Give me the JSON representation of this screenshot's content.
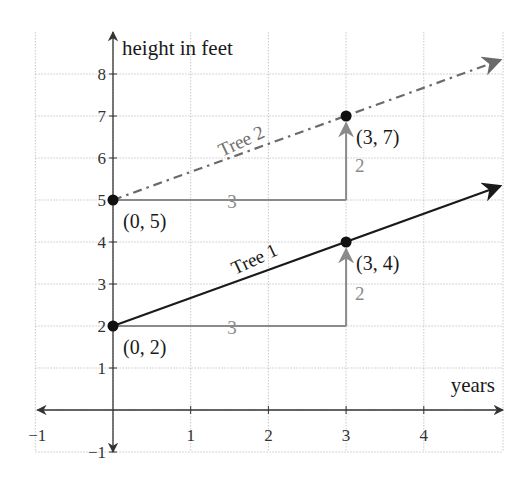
{
  "chart_data": {
    "type": "line",
    "title": "",
    "xlabel": "years",
    "ylabel": "height in feet",
    "xlim": [
      -1,
      5
    ],
    "ylim": [
      -1,
      8.5
    ],
    "grid": true,
    "x_ticks": [
      -1,
      1,
      2,
      3,
      4
    ],
    "y_ticks": [
      -1,
      1,
      2,
      3,
      4,
      5,
      6,
      7,
      8
    ],
    "x_tick_labels": [
      "−1",
      "1",
      "2",
      "3",
      "4"
    ],
    "y_tick_labels": [
      "−1",
      "1",
      "2",
      "3",
      "4",
      "5",
      "6",
      "7",
      "8"
    ],
    "series": [
      {
        "name": "Tree 1",
        "style": "solid",
        "color": "#1a1a1a",
        "equation": "y = (2/3)x + 2",
        "points": [
          [
            0,
            2
          ],
          [
            3,
            4
          ]
        ],
        "extends_to": [
          5,
          5.333
        ],
        "point_labels": [
          "(0, 2)",
          "(3, 4)"
        ],
        "run": {
          "value": 3,
          "label": "3",
          "from": [
            0,
            2
          ],
          "to": [
            3,
            2
          ]
        },
        "rise": {
          "value": 2,
          "label": "2",
          "from": [
            3,
            2
          ],
          "to": [
            3,
            4
          ]
        }
      },
      {
        "name": "Tree 2",
        "style": "dash-dot",
        "color": "#6a6a6a",
        "equation": "y = (2/3)x + 5",
        "points": [
          [
            0,
            5
          ],
          [
            3,
            7
          ]
        ],
        "extends_to": [
          5,
          8.333
        ],
        "point_labels": [
          "(0, 5)",
          "(3, 7)"
        ],
        "run": {
          "value": 3,
          "label": "3",
          "from": [
            0,
            5
          ],
          "to": [
            3,
            5
          ]
        },
        "rise": {
          "value": 2,
          "label": "2",
          "from": [
            3,
            5
          ],
          "to": [
            3,
            7
          ]
        }
      }
    ],
    "legend": null
  },
  "colors": {
    "axis": "#333333",
    "grid": "#c8c8c8",
    "tree1": "#1a1a1a",
    "tree2": "#6a6a6a",
    "step": "#8a8a8a"
  }
}
